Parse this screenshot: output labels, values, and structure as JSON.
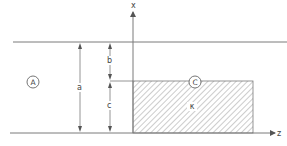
{
  "diagram": {
    "type": "cross-section schematic",
    "axes": {
      "x_label": "x",
      "z_label": "z"
    },
    "regions": {
      "region_a_label": "A",
      "region_c_label": "C",
      "region_c_material_symbol": "κ"
    },
    "dimensions": {
      "a": "a",
      "b": "b",
      "c": "c"
    },
    "colors": {
      "line": "#7a7a7a",
      "hatch": "#9a9a9a",
      "text": "#444444"
    }
  }
}
